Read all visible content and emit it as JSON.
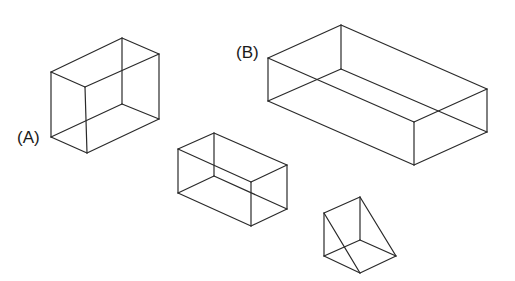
{
  "diagram": {
    "type": "wireframe-solids",
    "background": "#ffffff",
    "line_color": "#2a2a2a",
    "shapes": [
      {
        "id": "box-a",
        "kind": "rectangular-prism",
        "label": "(A)",
        "label_pos": [
          17,
          143
        ],
        "edges": [
          [
            [
              51,
              72
            ],
            [
              122,
              38
            ]
          ],
          [
            [
              122,
              38
            ],
            [
              159,
              54
            ]
          ],
          [
            [
              159,
              54
            ],
            [
              85,
              87
            ]
          ],
          [
            [
              85,
              87
            ],
            [
              51,
              72
            ]
          ],
          [
            [
              51,
              137
            ],
            [
              87,
              153
            ]
          ],
          [
            [
              87,
              153
            ],
            [
              159,
              119
            ]
          ],
          [
            [
              51,
              72
            ],
            [
              51,
              137
            ]
          ],
          [
            [
              85,
              87
            ],
            [
              87,
              153
            ]
          ],
          [
            [
              159,
              54
            ],
            [
              159,
              119
            ]
          ],
          [
            [
              122,
              38
            ],
            [
              122,
              104
            ]
          ],
          [
            [
              122,
              104
            ],
            [
              51,
              137
            ]
          ],
          [
            [
              122,
              104
            ],
            [
              159,
              119
            ]
          ]
        ]
      },
      {
        "id": "box-b",
        "kind": "rectangular-prism",
        "label": "(B)",
        "label_pos": [
          236,
          58
        ],
        "edges": [
          [
            [
              268,
              58
            ],
            [
              341,
              25
            ]
          ],
          [
            [
              341,
              25
            ],
            [
              487,
              89
            ]
          ],
          [
            [
              487,
              89
            ],
            [
              414,
              122
            ]
          ],
          [
            [
              414,
              122
            ],
            [
              268,
              58
            ]
          ],
          [
            [
              268,
              101
            ],
            [
              414,
              165
            ]
          ],
          [
            [
              414,
              165
            ],
            [
              487,
              132
            ]
          ],
          [
            [
              268,
              58
            ],
            [
              268,
              101
            ]
          ],
          [
            [
              414,
              122
            ],
            [
              414,
              165
            ]
          ],
          [
            [
              487,
              89
            ],
            [
              487,
              132
            ]
          ],
          [
            [
              341,
              25
            ],
            [
              341,
              69
            ]
          ],
          [
            [
              341,
              69
            ],
            [
              268,
              101
            ]
          ],
          [
            [
              341,
              69
            ],
            [
              487,
              132
            ]
          ]
        ]
      },
      {
        "id": "box-c",
        "kind": "rectangular-prism",
        "label": "",
        "edges": [
          [
            [
              178,
              149
            ],
            [
              214,
              133
            ]
          ],
          [
            [
              214,
              133
            ],
            [
              287,
              165
            ]
          ],
          [
            [
              287,
              165
            ],
            [
              251,
              182
            ]
          ],
          [
            [
              251,
              182
            ],
            [
              178,
              149
            ]
          ],
          [
            [
              178,
              193
            ],
            [
              251,
              226
            ]
          ],
          [
            [
              251,
              226
            ],
            [
              287,
              209
            ]
          ],
          [
            [
              178,
              149
            ],
            [
              178,
              193
            ]
          ],
          [
            [
              251,
              182
            ],
            [
              251,
              226
            ]
          ],
          [
            [
              287,
              165
            ],
            [
              287,
              209
            ]
          ],
          [
            [
              214,
              133
            ],
            [
              214,
              176
            ]
          ],
          [
            [
              214,
              176
            ],
            [
              178,
              193
            ]
          ],
          [
            [
              214,
              176
            ],
            [
              287,
              209
            ]
          ]
        ]
      },
      {
        "id": "wedge",
        "kind": "triangular-prism",
        "label": "",
        "edges": [
          [
            [
              324,
              213
            ],
            [
              360,
              197
            ]
          ],
          [
            [
              360,
              197
            ],
            [
              396,
              256
            ]
          ],
          [
            [
              324,
              213
            ],
            [
              360,
              273
            ]
          ],
          [
            [
              324,
              213
            ],
            [
              324,
              256
            ]
          ],
          [
            [
              360,
              197
            ],
            [
              360,
              240
            ]
          ],
          [
            [
              324,
              256
            ],
            [
              360,
              273
            ]
          ],
          [
            [
              360,
              273
            ],
            [
              396,
              256
            ]
          ],
          [
            [
              324,
              256
            ],
            [
              360,
              240
            ]
          ],
          [
            [
              360,
              240
            ],
            [
              396,
              256
            ]
          ]
        ]
      }
    ]
  }
}
